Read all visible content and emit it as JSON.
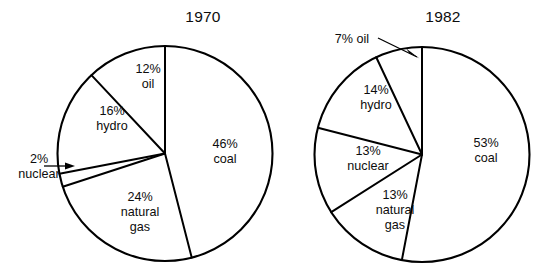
{
  "figure": {
    "background": "#ffffff",
    "line_color": "#000000",
    "text_color": "#0d0d0d"
  },
  "chart_data": [
    {
      "type": "pie",
      "title": "1970",
      "unit": "%",
      "start_angle_deg": 0,
      "direction": "clockwise",
      "labels": [
        "coal",
        "natural gas",
        "nuclear",
        "hydro",
        "oil"
      ],
      "values": [
        46,
        24,
        2,
        16,
        12
      ],
      "slices": [
        {
          "name": "coal",
          "percent": 46,
          "label_line1": "46%",
          "label_line2": "coal"
        },
        {
          "name": "natural gas",
          "percent": 24,
          "label_line1": "24%",
          "label_line2": "natural",
          "label_line3": "gas"
        },
        {
          "name": "nuclear",
          "percent": 2,
          "label_line1": "2%",
          "label_line2": "nuclear",
          "callout": true
        },
        {
          "name": "hydro",
          "percent": 16,
          "label_line1": "16%",
          "label_line2": "hydro"
        },
        {
          "name": "oil",
          "percent": 12,
          "label_line1": "12%",
          "label_line2": "oil"
        }
      ],
      "legend": "none",
      "grid": false
    },
    {
      "type": "pie",
      "title": "1982",
      "unit": "%",
      "start_angle_deg": 0,
      "direction": "clockwise",
      "labels": [
        "coal",
        "natural gas",
        "nuclear",
        "hydro",
        "oil"
      ],
      "values": [
        53,
        13,
        13,
        14,
        7
      ],
      "slices": [
        {
          "name": "coal",
          "percent": 53,
          "label_line1": "53%",
          "label_line2": "coal"
        },
        {
          "name": "natural gas",
          "percent": 13,
          "label_line1": "13%",
          "label_line2": "natural",
          "label_line3": "gas"
        },
        {
          "name": "nuclear",
          "percent": 13,
          "label_line1": "13%",
          "label_line2": "nuclear"
        },
        {
          "name": "hydro",
          "percent": 14,
          "label_line1": "14%",
          "label_line2": "hydro"
        },
        {
          "name": "oil",
          "percent": 7,
          "label_line1": "7% oil",
          "callout": true
        }
      ],
      "legend": "none",
      "grid": false
    }
  ],
  "charts": {
    "left": {
      "title": "1970",
      "labels": {
        "oil": {
          "l1": "12%",
          "l2": "oil"
        },
        "hydro": {
          "l1": "16%",
          "l2": "hydro"
        },
        "coal": {
          "l1": "46%",
          "l2": "coal"
        },
        "gas": {
          "l1": "24%",
          "l2": "natural",
          "l3": "gas"
        },
        "nuclear": {
          "l1": "2%",
          "l2": "nuclear"
        }
      }
    },
    "right": {
      "title": "1982",
      "labels": {
        "oil": {
          "l1": "7% oil"
        },
        "hydro": {
          "l1": "14%",
          "l2": "hydro"
        },
        "nuclear": {
          "l1": "13%",
          "l2": "nuclear"
        },
        "gas": {
          "l1": "13%",
          "l2": "natural",
          "l3": "gas"
        },
        "coal": {
          "l1": "53%",
          "l2": "coal"
        }
      }
    }
  }
}
